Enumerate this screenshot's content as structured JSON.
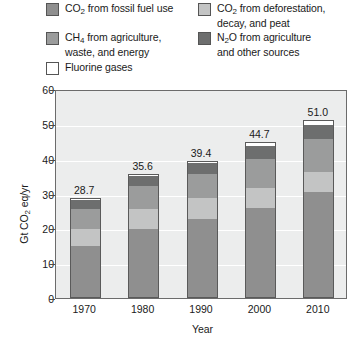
{
  "chart_data": {
    "type": "bar",
    "subtype": "stacked-bar",
    "title": "",
    "xlabel": "Year",
    "ylabel": "Gt CO2 eq/yr",
    "ylabel_parts": {
      "pre": "Gt CO",
      "sub": "2",
      "post": " eq/yr"
    },
    "categories": [
      "1970",
      "1980",
      "1990",
      "2000",
      "2010"
    ],
    "ylim": [
      0,
      60
    ],
    "yticks": [
      0,
      10,
      20,
      30,
      40,
      50,
      60
    ],
    "grid": true,
    "legend_position": "top",
    "totals": [
      28.7,
      35.6,
      39.4,
      44.7,
      51.0
    ],
    "total_labels": [
      "28.7",
      "35.6",
      "39.4",
      "44.7",
      "51.0"
    ],
    "series": [
      {
        "name": "CO2 from fossil fuel use",
        "color": "#8f8f8f",
        "values": [
          14.8,
          19.9,
          22.7,
          25.9,
          30.4
        ]
      },
      {
        "name": "CO2 from deforestation, decay, and peat",
        "color": "#c3c4c4",
        "values": [
          5.1,
          5.7,
          6.0,
          5.8,
          6.0
        ]
      },
      {
        "name": "CH4 from agriculture, waste, and energy",
        "color": "#9b9c9c",
        "values": [
          5.9,
          6.7,
          7.1,
          8.5,
          9.5
        ]
      },
      {
        "name": "N2O from agriculture and other sources",
        "color": "#6d6e6e",
        "values": [
          2.5,
          2.9,
          3.1,
          3.6,
          4.1
        ]
      },
      {
        "name": "Fluorine gases",
        "color": "#ffffff",
        "values": [
          0.4,
          0.4,
          0.5,
          0.9,
          1.0
        ]
      }
    ]
  },
  "legend": {
    "items": [
      {
        "name": "legend-co2-fossil",
        "swatch": "#8f8f8f",
        "text_pre": "CO",
        "text_sub": "2",
        "text_post": " from fossil fuel use"
      },
      {
        "name": "legend-co2-deforestation",
        "swatch": "#c3c4c4",
        "text_pre": "CO",
        "text_sub": "2",
        "text_post": " from deforestation,\ndecay, and peat"
      },
      {
        "name": "legend-ch4",
        "swatch": "#9b9c9c",
        "text_pre": "CH",
        "text_sub": "4",
        "text_post": " from agriculture,\nwaste, and energy"
      },
      {
        "name": "legend-n2o",
        "swatch": "#6d6e6e",
        "text_pre": "N",
        "text_sub": "2",
        "text_post": "O from agriculture\nand other sources"
      },
      {
        "name": "legend-fluorine",
        "swatch": "#ffffff",
        "text_pre": "Fluorine gases",
        "text_sub": "",
        "text_post": ""
      }
    ]
  },
  "colors": {
    "plot_background": "#eceded",
    "plot_border": "#6b6b6b",
    "gridline": "#ffffff",
    "text": "#1a1a1a"
  }
}
